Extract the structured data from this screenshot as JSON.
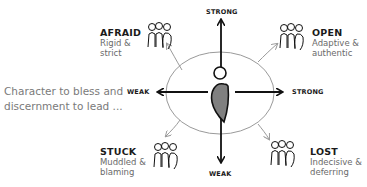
{
  "caption": "Character to bless and\ndiscernment to lead ...",
  "axes": {
    "top": "STRONG",
    "bottom": "WEAK",
    "left": "WEAK",
    "right": "STRONG"
  },
  "quadrants": {
    "top_left": {
      "title": "AFRAID",
      "desc": "Rigid &\nstrict"
    },
    "top_right": {
      "title": "OPEN",
      "desc": "Adaptive &\nauthentic"
    },
    "bottom_left": {
      "title": "STUCK",
      "desc": "Muddled &\nblaming"
    },
    "bottom_right": {
      "title": "LOST",
      "desc": "Indecisive &\ndeferring"
    }
  },
  "colors": {
    "axis": "#111111",
    "ellipse": "#9a9a9a",
    "quadrant_arrow": "#9a9a9a",
    "figure_fill": "#808080",
    "title_text": "#1a1a1a",
    "desc_text": "#6a6a6a",
    "caption_text": "#7a7a7a"
  }
}
